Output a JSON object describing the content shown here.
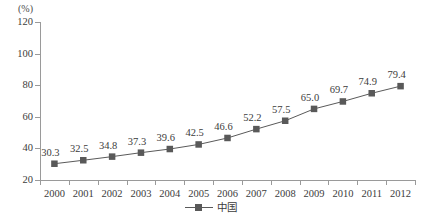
{
  "chart_data": {
    "type": "line",
    "title": "",
    "xlabel": "",
    "ylabel": "(%)",
    "unit_label": "(%)",
    "categories": [
      "2000",
      "2001",
      "2002",
      "2003",
      "2004",
      "2005",
      "2006",
      "2007",
      "2008",
      "2009",
      "2010",
      "2011",
      "2012"
    ],
    "values": [
      30.3,
      32.5,
      34.8,
      37.3,
      39.6,
      42.5,
      46.6,
      52.2,
      57.5,
      65.0,
      69.7,
      74.9,
      79.4
    ],
    "point_labels": [
      "30.3",
      "32.5",
      "34.8",
      "37.3",
      "39.6",
      "42.5",
      "46.6",
      "52.2",
      "57.5",
      "65.0",
      "69.7",
      "74.9",
      "79.4"
    ],
    "series": [
      {
        "name": "中国",
        "values": [
          30.3,
          32.5,
          34.8,
          37.3,
          39.6,
          42.5,
          46.6,
          52.2,
          57.5,
          65.0,
          69.7,
          74.9,
          79.4
        ],
        "color": "#595959",
        "marker": "square"
      }
    ],
    "ylim": [
      20,
      120
    ],
    "ytick_labels": [
      "120",
      "100",
      "80",
      "60",
      "40",
      "20"
    ],
    "ytick_values": [
      120,
      100,
      80,
      60,
      40,
      20
    ],
    "grid": false,
    "legend": {
      "position": "bottom-center",
      "entries": [
        {
          "label": "中国",
          "color": "#595959",
          "marker": "square"
        }
      ]
    },
    "colors": {
      "series": "#595959",
      "line": "#5a5a5a",
      "axis": "#9a9a9a",
      "text": "#3c3c3c",
      "background": "#ffffff"
    }
  }
}
